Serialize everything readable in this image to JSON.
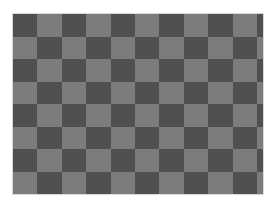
{
  "image": {
    "subject": "checkerboard pattern",
    "background_color": "#ffffff",
    "border_color": "#d8d8d8"
  },
  "board": {
    "left": 13,
    "top": 14,
    "width": 250,
    "height": 180,
    "rows": 8,
    "columns": 11,
    "cell_width": 24.4,
    "cell_height": 22.5,
    "dark_color": "#505050",
    "light_color": "#7c7c7c",
    "top_left_is_dark": true
  }
}
